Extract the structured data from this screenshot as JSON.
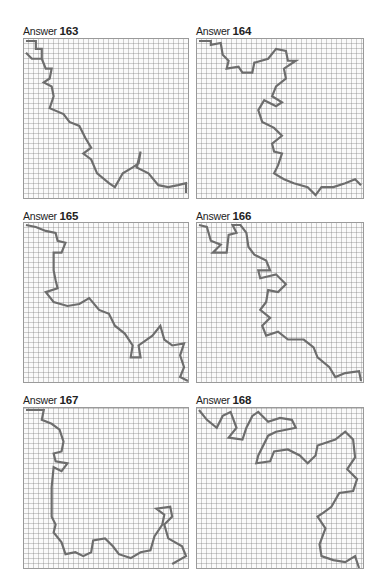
{
  "page": {
    "answers": [
      {
        "prefix": "Answer",
        "number": "163"
      },
      {
        "prefix": "Answer",
        "number": "164"
      },
      {
        "prefix": "Answer",
        "number": "165"
      },
      {
        "prefix": "Answer",
        "number": "166"
      },
      {
        "prefix": "Answer",
        "number": "167"
      },
      {
        "prefix": "Answer",
        "number": "168"
      }
    ]
  },
  "colors": {
    "maze_lines": "#9a9a9a",
    "solution_path": "#6d6d6d",
    "text": "#222222",
    "background": "#ffffff"
  }
}
